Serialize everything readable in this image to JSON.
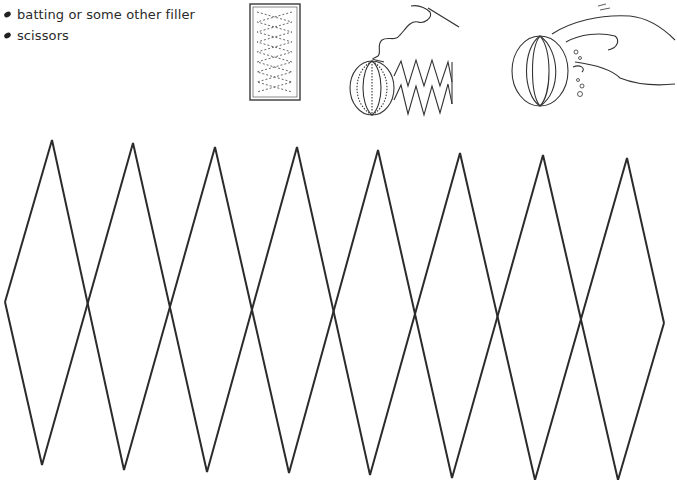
{
  "supplies": {
    "items": [
      {
        "icon": "bullet-icon",
        "label": "batting or some other filler"
      },
      {
        "icon": "bullet-icon",
        "label": "scissors"
      }
    ]
  },
  "illustrations": [
    {
      "name": "paper-strip-template",
      "description": "rectangle with dashed zigzag diamond pattern"
    },
    {
      "name": "needle-and-thread-ball",
      "description": "sewn half ball with zigzag strip and needle"
    },
    {
      "name": "hand-stuffing-ball",
      "description": "hand stuffing filler into ball"
    }
  ],
  "pattern": {
    "stroke_color": "#2b2b2b",
    "stroke_width": 2,
    "left_point": [
      5,
      302
    ],
    "right_point": [
      664,
      323
    ],
    "top_points": [
      [
        52,
        140
      ],
      [
        133,
        143
      ],
      [
        215,
        147
      ],
      [
        297,
        147
      ],
      [
        378,
        150
      ],
      [
        460,
        153
      ],
      [
        543,
        155
      ],
      [
        627,
        158
      ]
    ],
    "bottom_points": [
      [
        42,
        465
      ],
      [
        124,
        470
      ],
      [
        207,
        472
      ],
      [
        289,
        473
      ],
      [
        370,
        475
      ],
      [
        452,
        478
      ],
      [
        535,
        480
      ],
      [
        618,
        480
      ]
    ],
    "crossings": [
      [
        88,
        305
      ],
      [
        170,
        308
      ],
      [
        252,
        310
      ],
      [
        334,
        312
      ],
      [
        416,
        314
      ],
      [
        498,
        316
      ],
      [
        580,
        319
      ]
    ]
  }
}
